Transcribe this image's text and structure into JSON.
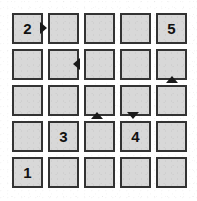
{
  "board": {
    "title": "Number Grid Puzzle",
    "rows": 5,
    "columns": 5,
    "cell_size_px": 31,
    "cell_pitch_px": 36,
    "origin_x_px": 12,
    "origin_y_px": 13,
    "colors": {
      "cell_fill": "#d8d8d8",
      "cell_border": "#333333",
      "background": "#ffffff",
      "number_text": "#111111",
      "arrow": "#1a1a1a"
    },
    "cells": [
      {
        "row": 0,
        "col": 0,
        "label": "2",
        "filled": true
      },
      {
        "row": 0,
        "col": 1,
        "label": "",
        "filled": false
      },
      {
        "row": 0,
        "col": 2,
        "label": "",
        "filled": false
      },
      {
        "row": 0,
        "col": 3,
        "label": "",
        "filled": false
      },
      {
        "row": 0,
        "col": 4,
        "label": "5",
        "filled": true
      },
      {
        "row": 1,
        "col": 0,
        "label": "",
        "filled": false
      },
      {
        "row": 1,
        "col": 1,
        "label": "",
        "filled": false
      },
      {
        "row": 1,
        "col": 2,
        "label": "",
        "filled": false
      },
      {
        "row": 1,
        "col": 3,
        "label": "",
        "filled": false
      },
      {
        "row": 1,
        "col": 4,
        "label": "",
        "filled": false
      },
      {
        "row": 2,
        "col": 0,
        "label": "",
        "filled": false
      },
      {
        "row": 2,
        "col": 1,
        "label": "",
        "filled": false
      },
      {
        "row": 2,
        "col": 2,
        "label": "",
        "filled": false
      },
      {
        "row": 2,
        "col": 3,
        "label": "",
        "filled": false
      },
      {
        "row": 2,
        "col": 4,
        "label": "",
        "filled": false
      },
      {
        "row": 3,
        "col": 0,
        "label": "",
        "filled": false
      },
      {
        "row": 3,
        "col": 1,
        "label": "3",
        "filled": true
      },
      {
        "row": 3,
        "col": 2,
        "label": "",
        "filled": false
      },
      {
        "row": 3,
        "col": 3,
        "label": "4",
        "filled": true
      },
      {
        "row": 3,
        "col": 4,
        "label": "",
        "filled": false
      },
      {
        "row": 4,
        "col": 0,
        "label": "1",
        "filled": true
      },
      {
        "row": 4,
        "col": 1,
        "label": "",
        "filled": false
      },
      {
        "row": 4,
        "col": 2,
        "label": "",
        "filled": false
      },
      {
        "row": 4,
        "col": 3,
        "label": "",
        "filled": false
      },
      {
        "row": 4,
        "col": 4,
        "label": "",
        "filled": false
      }
    ],
    "arrows": [
      {
        "icon": "arrow-right-icon",
        "direction": "right",
        "x": 40,
        "y": 22
      },
      {
        "icon": "arrow-left-icon",
        "direction": "left",
        "x": 73,
        "y": 58
      },
      {
        "icon": "arrow-up-icon",
        "direction": "up",
        "x": 166,
        "y": 76
      },
      {
        "icon": "arrow-up-icon",
        "direction": "up",
        "x": 91,
        "y": 112
      },
      {
        "icon": "arrow-down-icon",
        "direction": "down",
        "x": 127,
        "y": 112
      }
    ]
  }
}
